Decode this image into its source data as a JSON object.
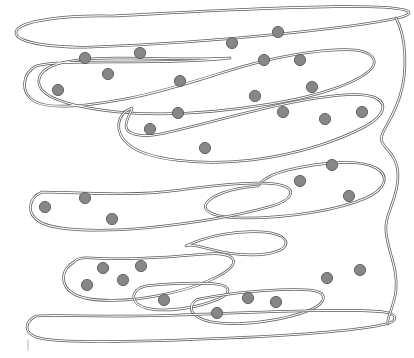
{
  "figure": {
    "width": 414,
    "height": 358,
    "background_color": "#ffffff"
  },
  "style": {
    "membrane_line_color": "#5d5d5d",
    "membrane_gap_color": "#ffffff",
    "membrane_outer_width": 2.6,
    "membrane_inner_width": 1.1,
    "granule_fill_color": "#878787",
    "granule_stroke_color": "#5a5a5a",
    "granule_radius": 5.6,
    "stray_mark_color": "#b8b8b8"
  },
  "membranes": [
    {
      "name": "membrane-band-1-top-fold",
      "label": "top serpentine fold",
      "path": "M 112 16 C 70 15, 18 20, 16 32 C 14 44, 60 48, 92 47 C 150 45, 220 40, 280 34 C 330 29, 370 24, 398 18 C 410 15, 412 12, 405 10 C 380 4, 300 7, 230 10 C 180 12, 140 15, 112 16 Z"
    },
    {
      "name": "membrane-band-2-left-lobe",
      "label": "second band left lobe with granules",
      "path": "M 36 66 C 22 74, 20 92, 34 101 C 48 110, 90 106, 130 98 C 175 89, 215 74, 252 64 C 290 54, 330 48, 355 50 C 372 52, 378 60, 372 68 C 360 82, 320 96, 270 104 C 215 113, 160 116, 118 112 C 78 108, 50 100, 42 90 C 36 82, 38 72, 52 66 C 66 60, 90 58, 118 58 C 160 58, 200 60, 230 58 C 200 62, 150 62, 110 62 C 80 62, 50 62, 36 66 Z"
    },
    {
      "name": "membrane-band-3-mid-lobe",
      "label": "third band lobe with granules",
      "path": "M 132 108 C 116 114, 114 132, 128 144 C 146 160, 200 166, 252 160 C 300 154, 340 140, 366 126 C 384 116, 388 104, 376 98 C 360 90, 320 96, 275 106 C 230 116, 190 128, 160 134 C 140 138, 126 134, 126 126 C 126 118, 132 112, 132 108 Z"
    },
    {
      "name": "membrane-band-4-right-lobe",
      "label": "fourth band right lobe with granules",
      "path": "M 258 186 C 230 188, 210 196, 206 204 C 202 212, 216 218, 244 218 C 290 218, 338 210, 366 198 C 386 189, 390 176, 376 168 C 360 159, 322 162, 288 170 C 272 174, 262 180, 258 186 Z"
    },
    {
      "name": "membrane-band-5-left-lobe",
      "label": "fifth band left elongated lobe",
      "path": "M 42 192 C 28 198, 26 214, 40 222 C 56 231, 100 232, 145 228 C 196 223, 244 214, 272 206 C 292 200, 296 190, 284 186 C 268 180, 224 184, 180 190 C 130 197, 70 192, 42 192 Z"
    },
    {
      "name": "membrane-band-6-s-curve",
      "label": "narrow S-curve connector",
      "path": "M 186 246 C 206 236, 236 230, 264 232 C 286 234, 292 244, 280 250 C 266 257, 236 256, 214 250 C 198 246, 190 244, 186 246 Z"
    },
    {
      "name": "membrane-band-7-lower-lobe",
      "label": "lower-left lobe with granule cluster",
      "path": "M 74 262 C 60 270, 60 286, 74 294 C 90 303, 130 302, 166 294 C 200 287, 226 274, 232 266 C 238 258, 228 252, 206 254 C 172 257, 120 260, 92 258 C 80 257, 76 259, 74 262 Z"
    },
    {
      "name": "membrane-band-8-small-inner-loop",
      "label": "small inner loop with single granule",
      "path": "M 140 288 C 130 294, 132 304, 146 308 C 164 313, 196 308, 216 300 C 232 294, 232 286, 216 284 C 196 282, 160 284, 146 286 C 142 287, 140 288, 140 288 Z"
    },
    {
      "name": "membrane-band-9-bottom-right-lobe",
      "label": "bottom-right lobe with granules",
      "path": "M 196 300 C 186 308, 192 318, 212 322 C 240 327, 286 320, 310 310 C 328 302, 328 292, 310 290 C 286 288, 240 292, 216 296 C 204 298, 198 299, 196 300 Z"
    },
    {
      "name": "membrane-band-10-bottom-long",
      "label": "long bottom horizontal fold",
      "path": "M 36 316 C 24 322, 24 332, 36 337 C 54 344, 140 342, 230 338 C 300 335, 360 330, 386 324 C 398 321, 398 314, 384 312 C 356 308, 260 312, 180 315 C 110 318, 52 314, 36 316 Z"
    },
    {
      "name": "membrane-right-edge-connector",
      "label": "right-hand return folds",
      "path": "M 396 18 C 406 36, 408 70, 400 96 C 392 122, 378 134, 382 142 C 386 150, 398 156, 398 176 C 398 200, 384 214, 386 232 C 388 252, 398 268, 396 290 C 394 308, 386 318, 388 324"
    }
  ],
  "granules": [
    {
      "name": "granule",
      "x": 85,
      "y": 58
    },
    {
      "name": "granule",
      "x": 140,
      "y": 53
    },
    {
      "name": "granule",
      "x": 108,
      "y": 74
    },
    {
      "name": "granule",
      "x": 58,
      "y": 90
    },
    {
      "name": "granule",
      "x": 180,
      "y": 81
    },
    {
      "name": "granule",
      "x": 232,
      "y": 43
    },
    {
      "name": "granule",
      "x": 278,
      "y": 32
    },
    {
      "name": "granule",
      "x": 264,
      "y": 60
    },
    {
      "name": "granule",
      "x": 300,
      "y": 60
    },
    {
      "name": "granule",
      "x": 255,
      "y": 96
    },
    {
      "name": "granule",
      "x": 312,
      "y": 87
    },
    {
      "name": "granule",
      "x": 283,
      "y": 112
    },
    {
      "name": "granule",
      "x": 325,
      "y": 119
    },
    {
      "name": "granule",
      "x": 362,
      "y": 112
    },
    {
      "name": "granule",
      "x": 178,
      "y": 113
    },
    {
      "name": "granule",
      "x": 150,
      "y": 129
    },
    {
      "name": "granule",
      "x": 205,
      "y": 148
    },
    {
      "name": "granule",
      "x": 332,
      "y": 165
    },
    {
      "name": "granule",
      "x": 300,
      "y": 181
    },
    {
      "name": "granule",
      "x": 349,
      "y": 196
    },
    {
      "name": "granule",
      "x": 45,
      "y": 207
    },
    {
      "name": "granule",
      "x": 85,
      "y": 198
    },
    {
      "name": "granule",
      "x": 112,
      "y": 219
    },
    {
      "name": "granule",
      "x": 103,
      "y": 268
    },
    {
      "name": "granule",
      "x": 141,
      "y": 266
    },
    {
      "name": "granule",
      "x": 123,
      "y": 280
    },
    {
      "name": "granule",
      "x": 87,
      "y": 285
    },
    {
      "name": "granule",
      "x": 164,
      "y": 300
    },
    {
      "name": "granule",
      "x": 327,
      "y": 278
    },
    {
      "name": "granule",
      "x": 360,
      "y": 270
    },
    {
      "name": "granule",
      "x": 248,
      "y": 298
    },
    {
      "name": "granule",
      "x": 276,
      "y": 302
    },
    {
      "name": "granule",
      "x": 217,
      "y": 313
    }
  ],
  "stray_marks": [
    {
      "name": "stray-tick-mark",
      "path": "M 28 340 L 28 350"
    }
  ],
  "counts": {
    "granule_count": 33,
    "membrane_segment_count": 11
  }
}
